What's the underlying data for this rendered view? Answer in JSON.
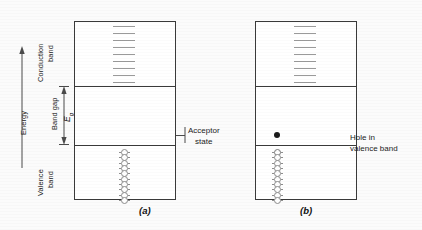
{
  "figure": {
    "background_color": "#fbfbfb",
    "line_color": "#3a3a3a",
    "level_color": "#9a9a9a",
    "state_color": "#8d8d8d",
    "electron_color": "#1a1a1a"
  },
  "axis": {
    "energy_label": "Energy",
    "arrow_direction": "up"
  },
  "band_labels": {
    "conduction_line1": "Conduction",
    "conduction_line2": "band",
    "band_gap": "Band gap",
    "band_gap_symbol": "E",
    "band_gap_subscript": "g",
    "valence_line1": "Valence",
    "valence_line2": "band"
  },
  "panels": [
    {
      "id": "a",
      "caption": "(a)",
      "conduction_levels": 9,
      "valence_states": 10,
      "valence_states_filled": 10,
      "has_acceptor_level": true,
      "has_free_electron_dot": false,
      "has_hole": false,
      "annotation": {
        "line1": "Acceptor",
        "line2": "state",
        "arrow": "left"
      }
    },
    {
      "id": "b",
      "caption": "(b)",
      "conduction_levels": 9,
      "valence_states": 10,
      "valence_states_filled": 9,
      "has_acceptor_level": false,
      "has_free_electron_dot": true,
      "has_hole": true,
      "annotation": {
        "line1": "Hole in",
        "line2": "valence band",
        "arrow": "curved-left"
      }
    }
  ]
}
